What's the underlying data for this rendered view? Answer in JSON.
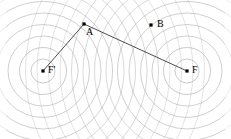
{
  "figure": {
    "width": 231,
    "height": 139,
    "background_color": "#ffffff"
  },
  "style": {
    "circle_stroke": "#9a9a9a",
    "circle_stroke_faint": "#c9c9c9",
    "segment_stroke": "#3a3a3a",
    "point_fill": "#000000",
    "label_color": "#000000"
  },
  "points": [
    {
      "id": "A",
      "label": "A",
      "x": 84,
      "y": 24,
      "label_x": 85,
      "label_y": 28,
      "label_anchor": "start"
    },
    {
      "id": "B",
      "label": "B",
      "x": 151,
      "y": 25,
      "label_x": 157,
      "label_y": 21,
      "label_anchor": "start"
    },
    {
      "id": "Fp",
      "label": "F′",
      "x": 43,
      "y": 71,
      "label_x": 48,
      "label_y": 67,
      "label_anchor": "start"
    },
    {
      "id": "F",
      "label": "F",
      "x": 187,
      "y": 71,
      "label_x": 192,
      "label_y": 67,
      "label_anchor": "start"
    }
  ],
  "segments": [
    {
      "id": "Fp-A",
      "from": "Fp",
      "to": "A",
      "x1": 43,
      "y1": 71,
      "x2": 84,
      "y2": 24
    },
    {
      "id": "A-F",
      "from": "A",
      "to": "F",
      "x1": 84,
      "y1": 24,
      "x2": 187,
      "y2": 71
    }
  ],
  "circle_families": [
    {
      "id": "family-left",
      "center_label": "F′",
      "cx": 43,
      "cy": 71,
      "radii": [
        12,
        23.5,
        35,
        46.5,
        58,
        69.5,
        81,
        92.5,
        104,
        115.5,
        127,
        138.5,
        150,
        161.5
      ]
    },
    {
      "id": "family-right",
      "center_label": "F",
      "cx": 187,
      "cy": 71,
      "radii": [
        12,
        23.5,
        35,
        46.5,
        58,
        69.5,
        81,
        92.5,
        104,
        115.5,
        127,
        138.5,
        150,
        161.5
      ]
    }
  ]
}
